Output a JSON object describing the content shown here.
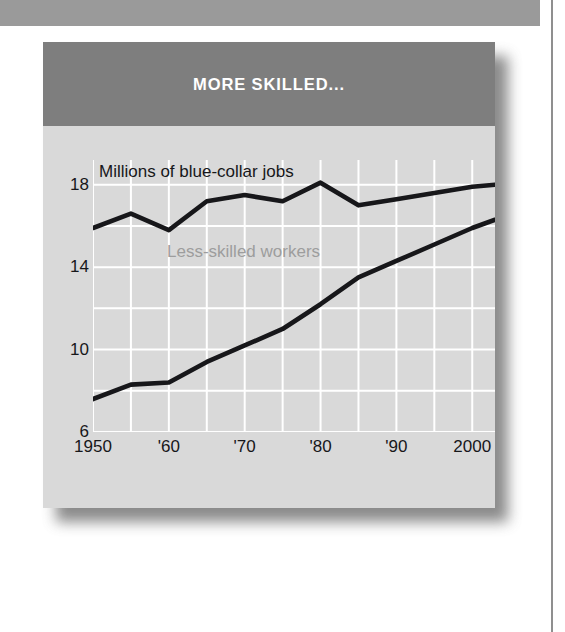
{
  "chart_title": "MORE SKILLED...",
  "annotations": {
    "units": "Millions of blue-collar jobs",
    "less_skilled": "Less-skilled workers",
    "more_skilled": "More-skilled workers"
  },
  "colors": {
    "header_band": "#7e7e7e",
    "plot_background": "#d9d9d9",
    "gridline": "#ffffff",
    "line": "#17171a",
    "title_text": "#ffffff",
    "less_skilled_label": "#9d9d9d",
    "page_band": "#9a9a9a"
  },
  "chart_data": {
    "type": "line",
    "title": "MORE SKILLED...",
    "subtitle": "Millions of blue-collar jobs",
    "xlabel": "",
    "ylabel": "Millions of blue-collar jobs",
    "xlim": [
      1950,
      2003
    ],
    "ylim": [
      6,
      19.2
    ],
    "ytick_values": [
      18,
      14,
      10,
      6
    ],
    "ytick_labels": [
      "18",
      "14",
      "10",
      "6"
    ],
    "xtick_values": [
      1950,
      1960,
      1970,
      1980,
      1990,
      2000
    ],
    "xtick_labels": [
      "1950",
      "'60",
      "'70",
      "'80",
      "'90",
      "2000"
    ],
    "grid": true,
    "grid_x_values": [
      1950,
      1955,
      1960,
      1965,
      1970,
      1975,
      1980,
      1985,
      1990,
      1995,
      2000
    ],
    "grid_y_values": [
      18,
      16,
      14,
      12,
      10,
      8,
      6
    ],
    "legend_position": "in-plot-annotations",
    "x": [
      1950,
      1955,
      1960,
      1965,
      1970,
      1975,
      1980,
      1985,
      1990,
      1995,
      2000,
      2003
    ],
    "series": [
      {
        "name": "Less-skilled workers",
        "label_in_plot": "Less-skilled workers",
        "values": [
          15.9,
          16.6,
          15.8,
          17.2,
          17.5,
          17.2,
          18.1,
          17.0,
          17.3,
          17.6,
          17.9,
          18.0
        ]
      },
      {
        "name": "More-skilled workers",
        "label_in_plot": "More-skilled workers",
        "values": [
          7.6,
          8.3,
          8.4,
          9.4,
          10.2,
          11.0,
          12.2,
          13.5,
          14.3,
          15.1,
          15.9,
          16.3
        ]
      }
    ]
  }
}
